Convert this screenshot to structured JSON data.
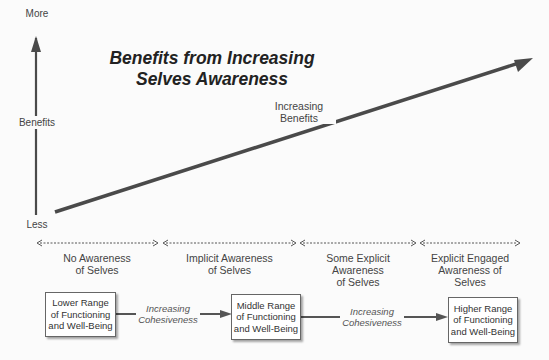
{
  "title": "Benefits  from Increasing\nSelves Awareness",
  "y_axis": {
    "top_label": "More",
    "middle_label": "Benefits",
    "bottom_label": "Less"
  },
  "trend_arrow": {
    "label": "Increasing\nBenefits"
  },
  "stages": [
    {
      "label": "No Awareness\nof Selves"
    },
    {
      "label": "Implicit Awareness\nof Selves"
    },
    {
      "label": "Some Explicit\nAwareness\nof Selves"
    },
    {
      "label": "Explicit Engaged\nAwareness of\nSelves"
    }
  ],
  "outcomes": [
    {
      "label": "Lower Range\nof Functioning\nand Well-Being"
    },
    {
      "label": "Middle Range\nof Functioning\nand Well-Being"
    },
    {
      "label": "Higher Range\nof Functioning\nand Well-Being"
    }
  ],
  "transitions": [
    {
      "label": "Increasing\nCohesiveness"
    },
    {
      "label": "Increasing\nCohesiveness"
    }
  ],
  "colors": {
    "arrow": "#4a4a4a",
    "background": "#fbfbfb",
    "text": "#3a3a3a"
  }
}
